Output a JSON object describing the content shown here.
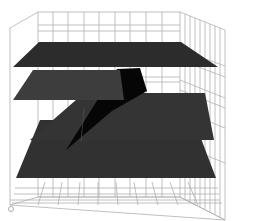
{
  "scene": {
    "title": "",
    "background": "#ffffff",
    "grid_color": "#a8a8a8",
    "frame_color": "#9a9a9a",
    "plane_colors": {
      "top": "#2d2d2d",
      "second": "#3a3a3a",
      "third": "#333333",
      "bottom": "#303030",
      "slab": "#050505"
    },
    "planes": [
      {
        "name": "top",
        "points": "39,42 181,42 218,67 13,67"
      },
      {
        "name": "second",
        "points": "33,70 152,70 158,100 13,100"
      },
      {
        "name": "third",
        "points": "84,93 205,93 214,140 32,140"
      },
      {
        "name": "bottom",
        "points": "40,120 194,120 216,178 16,178"
      },
      {
        "name": "slab",
        "points": "117,69 140,68 147,91 112,111 66,150"
      }
    ],
    "orientation_marker": {
      "cx": 11,
      "cy": 209,
      "r": 3
    }
  }
}
